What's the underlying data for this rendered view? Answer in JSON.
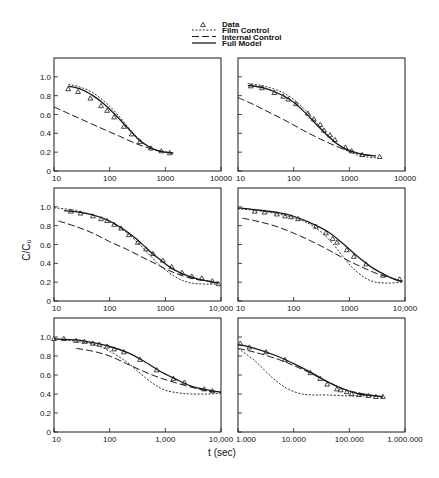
{
  "figure": {
    "width": 439,
    "height": 478,
    "ylabel": "C/C₀",
    "xlabel": "t (sec)",
    "colors": {
      "ink": "#1a1a1a",
      "background": "#ffffff"
    }
  },
  "legend": {
    "items": [
      {
        "label": "Data",
        "symbol": "triangle",
        "name": "legend-data"
      },
      {
        "label": "Film Control",
        "symbol": "dotted",
        "name": "legend-film-control"
      },
      {
        "label": "Internal Control",
        "symbol": "dashed",
        "name": "legend-internal-control"
      },
      {
        "label": "Full Model",
        "symbol": "solid",
        "name": "legend-full-model"
      }
    ]
  },
  "chart_data": [
    {
      "type": "line",
      "panel": "top-left",
      "xscale": "log",
      "xlim": [
        10,
        10000
      ],
      "ylim": [
        0,
        1.2
      ],
      "xticks": [
        10,
        100,
        1000,
        10000
      ],
      "xtick_labels": [
        "10",
        "100",
        "1000",
        "10000"
      ],
      "yticks": [
        0,
        0.2,
        0.4,
        0.6,
        0.8,
        1.0
      ],
      "ytick_labels": [
        "0",
        "0.2",
        "0.4",
        "0.6",
        "0.8",
        "1.0"
      ],
      "xlabel": "t (sec)",
      "ylabel": "C/C₀",
      "series": [
        {
          "name": "Data",
          "style": "triangle",
          "x": [
            18,
            27,
            45,
            70,
            90,
            120,
            180,
            250,
            350,
            550,
            850,
            1200
          ],
          "y": [
            0.87,
            0.84,
            0.77,
            0.69,
            0.64,
            0.57,
            0.47,
            0.39,
            0.31,
            0.24,
            0.21,
            0.19
          ]
        },
        {
          "name": "Film Control",
          "style": "dotted",
          "x": [
            18,
            30,
            50,
            80,
            120,
            180,
            250,
            350,
            500,
            700,
            1000,
            1400
          ],
          "y": [
            0.92,
            0.89,
            0.83,
            0.74,
            0.64,
            0.52,
            0.42,
            0.33,
            0.26,
            0.22,
            0.2,
            0.19
          ]
        },
        {
          "name": "Internal Control",
          "style": "dashed",
          "x": [
            10,
            20,
            40,
            80,
            150,
            300,
            600,
            1000,
            1400
          ],
          "y": [
            0.68,
            0.6,
            0.52,
            0.44,
            0.37,
            0.29,
            0.23,
            0.2,
            0.19
          ]
        },
        {
          "name": "Full Model",
          "style": "solid",
          "x": [
            18,
            30,
            50,
            80,
            120,
            180,
            250,
            350,
            500,
            700,
            1000,
            1400
          ],
          "y": [
            0.9,
            0.87,
            0.8,
            0.71,
            0.61,
            0.5,
            0.41,
            0.32,
            0.26,
            0.22,
            0.2,
            0.19
          ]
        }
      ]
    },
    {
      "type": "line",
      "panel": "top-right",
      "xscale": "log",
      "xlim": [
        10,
        10000
      ],
      "ylim": [
        0,
        1.2
      ],
      "xticks": [
        10,
        100,
        1000,
        10000
      ],
      "xtick_labels": [
        "10",
        "100",
        "1000",
        "10000"
      ],
      "yticks": [
        0,
        0.2,
        0.4,
        0.6,
        0.8,
        1.0
      ],
      "series": [
        {
          "name": "Data",
          "style": "triangle",
          "x": [
            17,
            27,
            45,
            65,
            80,
            110,
            180,
            230,
            300,
            350,
            450,
            550,
            850,
            1100,
            1700,
            3500
          ],
          "y": [
            0.9,
            0.88,
            0.83,
            0.79,
            0.76,
            0.71,
            0.61,
            0.55,
            0.49,
            0.43,
            0.38,
            0.33,
            0.25,
            0.21,
            0.17,
            0.15
          ]
        },
        {
          "name": "Film Control",
          "style": "dotted",
          "x": [
            15,
            30,
            60,
            100,
            160,
            250,
            400,
            600,
            900,
            1400,
            2000,
            3000
          ],
          "y": [
            0.93,
            0.9,
            0.84,
            0.76,
            0.65,
            0.52,
            0.39,
            0.29,
            0.22,
            0.17,
            0.15,
            0.14
          ]
        },
        {
          "name": "Internal Control",
          "style": "dashed",
          "x": [
            10,
            20,
            40,
            80,
            150,
            300,
            600,
            1000,
            2000,
            3000
          ],
          "y": [
            0.78,
            0.7,
            0.61,
            0.52,
            0.43,
            0.34,
            0.26,
            0.21,
            0.17,
            0.16
          ]
        },
        {
          "name": "Full Model",
          "style": "solid",
          "x": [
            15,
            30,
            60,
            100,
            160,
            250,
            400,
            600,
            900,
            1400,
            2000,
            3000
          ],
          "y": [
            0.91,
            0.88,
            0.81,
            0.73,
            0.62,
            0.5,
            0.38,
            0.29,
            0.23,
            0.19,
            0.17,
            0.16
          ]
        }
      ]
    },
    {
      "type": "line",
      "panel": "middle-left",
      "xscale": "log",
      "xlim": [
        10,
        10000
      ],
      "ylim": [
        0,
        1.2
      ],
      "xticks": [
        10,
        100,
        1000,
        10000
      ],
      "xtick_labels": [
        "10",
        "100",
        "1000",
        "10,000"
      ],
      "yticks": [
        0,
        0.2,
        0.4,
        0.6,
        0.8,
        1.0
      ],
      "ytick_labels": [
        "0",
        "0.2",
        "0.4",
        "0.6",
        "0.8",
        "1.0"
      ],
      "series": [
        {
          "name": "Data",
          "style": "triangle",
          "x": [
            20,
            30,
            50,
            70,
            90,
            120,
            160,
            220,
            320,
            450,
            600,
            900,
            1300,
            2000,
            3000,
            4500,
            7000,
            9000
          ],
          "y": [
            0.95,
            0.93,
            0.9,
            0.87,
            0.85,
            0.81,
            0.77,
            0.7,
            0.62,
            0.55,
            0.5,
            0.43,
            0.36,
            0.3,
            0.26,
            0.24,
            0.21,
            0.18
          ]
        },
        {
          "name": "Film Control",
          "style": "dotted",
          "x": [
            10,
            20,
            40,
            80,
            150,
            250,
            400,
            600,
            900,
            1400,
            2000,
            3000,
            5000,
            9000
          ],
          "y": [
            0.99,
            0.97,
            0.93,
            0.87,
            0.78,
            0.68,
            0.56,
            0.45,
            0.35,
            0.27,
            0.22,
            0.19,
            0.18,
            0.18
          ]
        },
        {
          "name": "Internal Control",
          "style": "dashed",
          "x": [
            12,
            25,
            50,
            100,
            200,
            400,
            700,
            1200,
            2000,
            3500,
            6000,
            9000
          ],
          "y": [
            0.85,
            0.79,
            0.72,
            0.63,
            0.55,
            0.46,
            0.39,
            0.32,
            0.27,
            0.23,
            0.21,
            0.2
          ]
        },
        {
          "name": "Full Model",
          "style": "solid",
          "x": [
            15,
            30,
            60,
            100,
            180,
            300,
            500,
            800,
            1200,
            2000,
            3500,
            6000,
            9000
          ],
          "y": [
            0.96,
            0.94,
            0.9,
            0.85,
            0.76,
            0.66,
            0.54,
            0.44,
            0.36,
            0.29,
            0.24,
            0.21,
            0.19
          ]
        }
      ]
    },
    {
      "type": "line",
      "panel": "middle-right",
      "xscale": "log",
      "xlim": [
        10,
        10000
      ],
      "ylim": [
        0,
        1.2
      ],
      "xticks": [
        10,
        100,
        1000,
        10000
      ],
      "xtick_labels": [
        "10",
        "100",
        "1000",
        "10,000"
      ],
      "yticks": [
        0,
        0.2,
        0.4,
        0.6,
        0.8,
        1.0
      ],
      "series": [
        {
          "name": "Data",
          "style": "triangle",
          "x": [
            20,
            30,
            50,
            70,
            90,
            120,
            250,
            380,
            500,
            600,
            900,
            1200,
            2000,
            4000,
            8000
          ],
          "y": [
            0.95,
            0.94,
            0.92,
            0.9,
            0.89,
            0.87,
            0.79,
            0.72,
            0.66,
            0.62,
            0.54,
            0.47,
            0.39,
            0.27,
            0.23
          ]
        },
        {
          "name": "Film Control",
          "style": "dotted",
          "x": [
            10,
            30,
            70,
            150,
            300,
            500,
            800,
            1200,
            2000,
            3000,
            5000,
            9000
          ],
          "y": [
            0.98,
            0.95,
            0.91,
            0.85,
            0.74,
            0.61,
            0.46,
            0.34,
            0.24,
            0.2,
            0.19,
            0.2
          ]
        },
        {
          "name": "Internal Control",
          "style": "dashed",
          "x": [
            12,
            25,
            50,
            100,
            200,
            400,
            700,
            1200,
            2000,
            3500,
            6000,
            9000
          ],
          "y": [
            0.88,
            0.84,
            0.79,
            0.72,
            0.64,
            0.55,
            0.47,
            0.4,
            0.34,
            0.28,
            0.24,
            0.21
          ]
        },
        {
          "name": "Full Model",
          "style": "solid",
          "x": [
            10,
            20,
            50,
            100,
            200,
            400,
            700,
            1000,
            1500,
            2500,
            4000,
            6500,
            9000
          ],
          "y": [
            0.99,
            0.97,
            0.94,
            0.9,
            0.83,
            0.74,
            0.63,
            0.55,
            0.46,
            0.36,
            0.29,
            0.23,
            0.21
          ]
        }
      ]
    },
    {
      "type": "line",
      "panel": "bottom-left",
      "xscale": "log",
      "xlim": [
        10,
        10000
      ],
      "ylim": [
        0,
        1.2
      ],
      "xticks": [
        10,
        100,
        1000,
        10000
      ],
      "xtick_labels": [
        "10",
        "100",
        "1,000",
        "10,000"
      ],
      "yticks": [
        0,
        0.2,
        0.4,
        0.6,
        0.8,
        1.0
      ],
      "ytick_labels": [
        "0",
        "0.2",
        "0.4",
        "0.6",
        "0.8",
        "1.0"
      ],
      "series": [
        {
          "name": "Data",
          "style": "triangle",
          "x": [
            10,
            15,
            25,
            35,
            50,
            65,
            90,
            120,
            180,
            350,
            700,
            1400,
            2200,
            5000,
            7000
          ],
          "y": [
            0.98,
            0.98,
            0.96,
            0.95,
            0.93,
            0.92,
            0.9,
            0.87,
            0.84,
            0.76,
            0.65,
            0.56,
            0.52,
            0.45,
            0.43
          ]
        },
        {
          "name": "Film Control",
          "style": "dotted",
          "x": [
            10,
            30,
            60,
            100,
            200,
            350,
            600,
            1000,
            1800,
            3000,
            6000,
            10000
          ],
          "y": [
            0.98,
            0.95,
            0.91,
            0.85,
            0.74,
            0.62,
            0.51,
            0.44,
            0.41,
            0.4,
            0.4,
            0.41
          ]
        },
        {
          "name": "Internal Control",
          "style": "dashed",
          "x": [
            25,
            50,
            100,
            200,
            400,
            800,
            1500,
            3000,
            6000,
            10000
          ],
          "y": [
            0.88,
            0.85,
            0.8,
            0.72,
            0.64,
            0.57,
            0.52,
            0.47,
            0.43,
            0.42
          ]
        },
        {
          "name": "Full Model",
          "style": "solid",
          "x": [
            10,
            25,
            50,
            100,
            200,
            400,
            800,
            1500,
            3000,
            6000,
            10000
          ],
          "y": [
            0.98,
            0.97,
            0.94,
            0.9,
            0.84,
            0.75,
            0.64,
            0.56,
            0.48,
            0.44,
            0.42
          ]
        }
      ]
    },
    {
      "type": "line",
      "panel": "bottom-right",
      "xscale": "log",
      "xlim": [
        1000,
        1000000
      ],
      "ylim": [
        0,
        1.2
      ],
      "xticks": [
        1000,
        10000,
        100000,
        1000000
      ],
      "xtick_labels": [
        "1.000",
        "10.000",
        "100.000",
        "1.000.000"
      ],
      "yticks": [
        0,
        0.2,
        0.4,
        0.6,
        0.8,
        1.0
      ],
      "series": [
        {
          "name": "Data",
          "style": "triangle",
          "x": [
            1100,
            1600,
            3200,
            7000,
            20000,
            30000,
            40000,
            60000,
            70000,
            90000,
            110000,
            150000,
            220000,
            300000,
            400000
          ],
          "y": [
            0.93,
            0.89,
            0.84,
            0.76,
            0.62,
            0.56,
            0.5,
            0.45,
            0.44,
            0.42,
            0.4,
            0.39,
            0.38,
            0.37,
            0.37
          ]
        },
        {
          "name": "Film Control",
          "style": "dotted",
          "x": [
            1000,
            2000,
            4000,
            7000,
            12000,
            20000,
            40000,
            100000,
            200000,
            400000
          ],
          "y": [
            0.88,
            0.75,
            0.58,
            0.47,
            0.41,
            0.39,
            0.39,
            0.38,
            0.38,
            0.37
          ]
        },
        {
          "name": "Internal Control",
          "style": "dashed",
          "x": [
            1000,
            2000,
            5000,
            10000,
            20000,
            40000,
            80000,
            150000,
            300000,
            400000
          ],
          "y": [
            0.88,
            0.84,
            0.77,
            0.7,
            0.62,
            0.53,
            0.45,
            0.41,
            0.38,
            0.37
          ]
        },
        {
          "name": "Full Model",
          "style": "solid",
          "x": [
            1000,
            2000,
            5000,
            10000,
            20000,
            40000,
            80000,
            150000,
            300000,
            400000
          ],
          "y": [
            0.92,
            0.88,
            0.8,
            0.72,
            0.63,
            0.53,
            0.45,
            0.4,
            0.38,
            0.37
          ]
        }
      ]
    }
  ],
  "layout": {
    "panels": [
      {
        "left": 54,
        "top": 58,
        "right": 221,
        "bottom": 171,
        "show_ylabels": true
      },
      {
        "left": 238,
        "top": 58,
        "right": 405,
        "bottom": 171,
        "show_ylabels": false
      },
      {
        "left": 54,
        "top": 188,
        "right": 221,
        "bottom": 301,
        "show_ylabels": true
      },
      {
        "left": 238,
        "top": 188,
        "right": 405,
        "bottom": 301,
        "show_ylabels": false
      },
      {
        "left": 54,
        "top": 318,
        "right": 221,
        "bottom": 432,
        "show_ylabels": true
      },
      {
        "left": 238,
        "top": 318,
        "right": 405,
        "bottom": 432,
        "show_ylabels": false
      }
    ]
  }
}
